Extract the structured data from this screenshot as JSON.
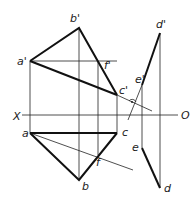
{
  "labels": {
    "b_prime": "b'",
    "a_prime": "a'",
    "f_prime": "f'",
    "c_prime": "c'",
    "d_prime": "d'",
    "e_prime": "e'",
    "X": "X",
    "O": "O",
    "a": "a",
    "c": "c",
    "e": "e",
    "f": "f",
    "b": "b",
    "d": "d"
  },
  "colors": {
    "line": "#1a1a1a",
    "background": "#ffffff"
  }
}
